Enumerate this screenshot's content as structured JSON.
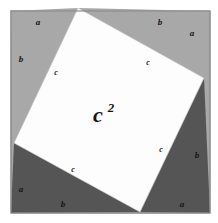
{
  "figure": {
    "canvas": {
      "width": 218,
      "height": 223
    },
    "background_color": "#ffffff"
  },
  "colors": {
    "outer_square_border": "#8e8e8e",
    "triangle_light": "#a8a8a8",
    "triangle_dark": "#555555",
    "inner_square_fill": "#fdfdfd",
    "label_color": "#141414",
    "edge_line": "#9a9a9a"
  },
  "geometry": {
    "outer_square": {
      "x": 11,
      "y": 11,
      "width": 199,
      "height": 202,
      "corners": [
        [
          11,
          11
        ],
        [
          210,
          11
        ],
        [
          210,
          213
        ],
        [
          11,
          213
        ]
      ]
    },
    "inner_square": {
      "label": "c²",
      "vertices": [
        [
          78,
          8
        ],
        [
          204,
          78
        ],
        [
          140,
          212
        ],
        [
          14,
          143
        ]
      ],
      "fill": "#fdfdfd"
    },
    "triangles": [
      {
        "name": "top-left-triangle",
        "shade": "light",
        "fill": "#a8a8a8",
        "points": [
          [
            11,
            11
          ],
          [
            78,
            8
          ],
          [
            14,
            143
          ]
        ]
      },
      {
        "name": "top-right-triangle",
        "shade": "light",
        "fill": "#a8a8a8",
        "points": [
          [
            78,
            8
          ],
          [
            210,
            11
          ],
          [
            204,
            78
          ]
        ]
      },
      {
        "name": "bottom-right-triangle",
        "shade": "dark",
        "fill": "#555555",
        "points": [
          [
            204,
            78
          ],
          [
            210,
            213
          ],
          [
            140,
            212
          ]
        ]
      },
      {
        "name": "bottom-left-triangle",
        "shade": "dark",
        "fill": "#555555",
        "points": [
          [
            14,
            143
          ],
          [
            140,
            212
          ],
          [
            11,
            213
          ]
        ]
      }
    ]
  },
  "labels": {
    "legs_a": [
      {
        "id": "a-top-left",
        "text": "a",
        "x": 38,
        "y": 25
      },
      {
        "id": "a-top-right",
        "text": "a",
        "x": 192,
        "y": 36
      },
      {
        "id": "a-bottom-right",
        "text": "a",
        "x": 182,
        "y": 207
      },
      {
        "id": "a-bottom-left",
        "text": "a",
        "x": 21,
        "y": 192
      }
    ],
    "legs_b": [
      {
        "id": "b-top-right",
        "text": "b",
        "x": 160,
        "y": 25
      },
      {
        "id": "b-right",
        "text": "b",
        "x": 197,
        "y": 158
      },
      {
        "id": "b-bottom",
        "text": "b",
        "x": 63,
        "y": 207
      },
      {
        "id": "b-left",
        "text": "b",
        "x": 21,
        "y": 62
      }
    ],
    "hypotenuses_c": [
      {
        "id": "c-upper-left",
        "text": "c",
        "x": 56,
        "y": 75
      },
      {
        "id": "c-upper-right",
        "text": "c",
        "x": 148,
        "y": 65
      },
      {
        "id": "c-lower-right",
        "text": "c",
        "x": 161,
        "y": 152
      },
      {
        "id": "c-lower-left",
        "text": "c",
        "x": 73,
        "y": 172
      }
    ],
    "area": {
      "id": "inner-square-area",
      "base": "c",
      "exponent": "2",
      "x": 98,
      "y": 122
    }
  }
}
